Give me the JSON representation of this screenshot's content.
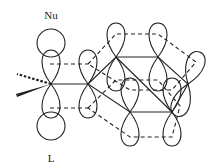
{
  "diagram": {
    "type": "orbital-diagram",
    "labels": {
      "nucleophile": "Nu",
      "leaving_group": "L"
    },
    "colors": {
      "stroke": "#222222",
      "background": "#ffffff"
    }
  }
}
